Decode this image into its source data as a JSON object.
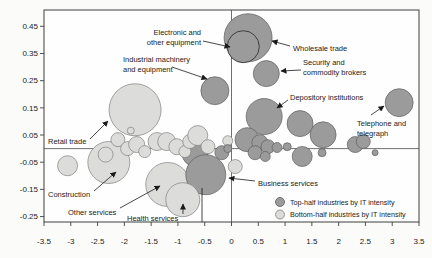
{
  "chart_data": {
    "type": "bubble",
    "title": "",
    "xlabel": "",
    "ylabel": "",
    "xlim": [
      -3.5,
      3.5
    ],
    "ylim": [
      -0.27,
      0.51
    ],
    "grid": "zero-lines-only",
    "legend_position": "bottom-right-inside",
    "x_ticks": [
      "-3.5",
      "-3",
      "-2.5",
      "-2",
      "-1.5",
      "-1",
      "-0.5",
      "0",
      "0.5",
      "1",
      "1.5",
      "2",
      "2.5",
      "3",
      "3.5"
    ],
    "y_ticks": [
      "0.45",
      "0.35",
      "0.25",
      "0.15",
      "0.05",
      "-0.05",
      "-0.15",
      "-0.25"
    ],
    "groups": {
      "top": {
        "label": "Top-half industries by IT intensity",
        "fill": "#9b9b9b",
        "stroke": "#5e5e5e"
      },
      "bottom": {
        "label": "Bottom-half industries by IT intensity",
        "fill": "#dcdcda",
        "stroke": "#7f7f7f"
      }
    },
    "bubbles": [
      {
        "g": "bottom",
        "x": -1.8,
        "y": 0.143,
        "r": 26,
        "label": "Retail trade"
      },
      {
        "g": "bottom",
        "x": -2.29,
        "y": -0.051,
        "r": 21,
        "label": "Construction"
      },
      {
        "g": "bottom",
        "x": -2.35,
        "y": -0.022,
        "r": 7.5
      },
      {
        "g": "top",
        "x": 0.31,
        "y": 0.408,
        "r": 24,
        "label": "Wholesale trade"
      },
      {
        "g": "top",
        "x": 0.22,
        "y": 0.375,
        "r": 16,
        "label": "Electronic and other equipment",
        "outlined": true
      },
      {
        "g": "top",
        "x": 0.65,
        "y": 0.276,
        "r": 13,
        "label": "Security and commodity brokers"
      },
      {
        "g": "top",
        "x": -0.31,
        "y": 0.213,
        "r": 14,
        "label": "Industrial machinery and equipment"
      },
      {
        "g": "top",
        "x": 0.61,
        "y": 0.118,
        "r": 18,
        "label": "Depository institutions"
      },
      {
        "g": "top",
        "x": 1.28,
        "y": 0.092,
        "r": 13
      },
      {
        "g": "top",
        "x": 1.71,
        "y": 0.051,
        "r": 13
      },
      {
        "g": "top",
        "x": 3.13,
        "y": 0.169,
        "r": 14,
        "label": "Telephone and telegraph"
      },
      {
        "g": "bottom",
        "x": -1.19,
        "y": -0.132,
        "r": 22,
        "label": "Other services"
      },
      {
        "g": "top",
        "x": -0.68,
        "y": -0.018,
        "r": 13
      },
      {
        "g": "top",
        "x": -0.48,
        "y": -0.096,
        "r": 20,
        "label": "Business services"
      },
      {
        "g": "bottom",
        "x": -0.91,
        "y": -0.188,
        "r": 17,
        "label": "Health services"
      },
      {
        "g": "bottom",
        "x": -1.88,
        "y": 0.066,
        "r": 3.5
      },
      {
        "g": "bottom",
        "x": -3.06,
        "y": -0.063,
        "r": 10
      },
      {
        "g": "bottom",
        "x": -2.12,
        "y": 0.033,
        "r": 7
      },
      {
        "g": "bottom",
        "x": -1.94,
        "y": 0.0,
        "r": 7
      },
      {
        "g": "bottom",
        "x": -1.77,
        "y": 0.015,
        "r": 8
      },
      {
        "g": "bottom",
        "x": -1.62,
        "y": -0.011,
        "r": 6
      },
      {
        "g": "bottom",
        "x": -1.39,
        "y": 0.026,
        "r": 9
      },
      {
        "g": "bottom",
        "x": -1.21,
        "y": 0.026,
        "r": 9
      },
      {
        "g": "bottom",
        "x": -1.02,
        "y": 0.007,
        "r": 8
      },
      {
        "g": "bottom",
        "x": -0.87,
        "y": -0.011,
        "r": 6
      },
      {
        "g": "bottom",
        "x": -0.78,
        "y": 0.026,
        "r": 7
      },
      {
        "g": "bottom",
        "x": -0.63,
        "y": 0.048,
        "r": 10
      },
      {
        "g": "bottom",
        "x": -0.44,
        "y": 0.007,
        "r": 7
      },
      {
        "g": "bottom",
        "x": 0.07,
        "y": -0.066,
        "r": 7
      },
      {
        "g": "bottom",
        "x": -0.07,
        "y": 0.029,
        "r": 5
      },
      {
        "g": "top",
        "x": -0.18,
        "y": -0.015,
        "r": 7
      },
      {
        "g": "top",
        "x": 0.29,
        "y": 0.033,
        "r": 12
      },
      {
        "g": "top",
        "x": 0.53,
        "y": 0.022,
        "r": 8
      },
      {
        "g": "top",
        "x": 0.68,
        "y": 0.007,
        "r": 7
      },
      {
        "g": "top",
        "x": 0.44,
        "y": -0.015,
        "r": 7
      },
      {
        "g": "top",
        "x": 0.85,
        "y": 0.004,
        "r": 5
      },
      {
        "g": "top",
        "x": 1.04,
        "y": 0.007,
        "r": 4
      },
      {
        "g": "top",
        "x": 0.63,
        "y": -0.029,
        "r": 5
      },
      {
        "g": "top",
        "x": 1.32,
        "y": -0.029,
        "r": 10
      },
      {
        "g": "top",
        "x": 1.69,
        "y": -0.015,
        "r": 4
      },
      {
        "g": "top",
        "x": 2.31,
        "y": 0.015,
        "r": 8
      },
      {
        "g": "top",
        "x": 2.46,
        "y": 0.026,
        "r": 7
      },
      {
        "g": "top",
        "x": 2.68,
        "y": -0.015,
        "r": 3
      },
      {
        "g": "top",
        "x": -0.07,
        "y": 0.0,
        "r": 4
      }
    ],
    "annotations": [
      {
        "text": [
          "Electronic and",
          "other equipment"
        ],
        "x": 201,
        "y": 35,
        "align": "end",
        "arrow": [
          203,
          41,
          230,
          47
        ]
      },
      {
        "text": [
          "Industrial machinery",
          "and equipment"
        ],
        "x": 123,
        "y": 62,
        "align": "start",
        "arrow": [
          172,
          67,
          207,
          79
        ]
      },
      {
        "text": [
          "Wholesale trade"
        ],
        "x": 293,
        "y": 51,
        "align": "start",
        "arrow": [
          290,
          46,
          272,
          41
        ]
      },
      {
        "text": [
          "Security and",
          "commodity brokers"
        ],
        "x": 303,
        "y": 65,
        "align": "start",
        "arrow": [
          301,
          70,
          281,
          71
        ]
      },
      {
        "text": [
          "Depository institutions"
        ],
        "x": 290,
        "y": 100,
        "align": "start",
        "arrow": [
          288,
          100,
          277,
          108
        ]
      },
      {
        "text": [
          "Telephone and",
          "telegraph"
        ],
        "x": 357,
        "y": 126,
        "align": "start",
        "arrow": [
          371,
          115,
          384,
          106
        ]
      },
      {
        "text": [
          "Retail trade"
        ],
        "x": 48,
        "y": 144,
        "align": "start",
        "arrow": [
          90,
          139,
          108,
          121
        ]
      },
      {
        "text": [
          "Construction"
        ],
        "x": 48,
        "y": 197,
        "align": "start",
        "arrow": [
          94,
          191,
          116,
          172
        ]
      },
      {
        "text": [
          "Other services"
        ],
        "x": 68,
        "y": 215,
        "align": "start",
        "arrow": [
          120,
          208,
          160,
          186
        ]
      },
      {
        "text": [
          "Health services"
        ],
        "x": 127,
        "y": 221,
        "align": "start",
        "arrow": [
          183,
          214,
          183,
          204
        ],
        "leader": [
          202,
          188,
          202,
          222
        ]
      },
      {
        "text": [
          "Business services"
        ],
        "x": 258,
        "y": 186,
        "align": "start",
        "arrow": [
          255,
          181,
          229,
          178
        ]
      }
    ],
    "legend": {
      "items": [
        {
          "group": "top",
          "label": "Top-half industries by IT intensity"
        },
        {
          "group": "bottom",
          "label": "Bottom-half industries by IT intensity"
        }
      ]
    },
    "colors": {
      "axis": "#3f3f3f",
      "zero_line": "#4a4a4a",
      "arrow": "#1a1a1a",
      "plot_bg": "#fefefe",
      "outlined_bubble_stroke": "#3e3e3e"
    }
  }
}
